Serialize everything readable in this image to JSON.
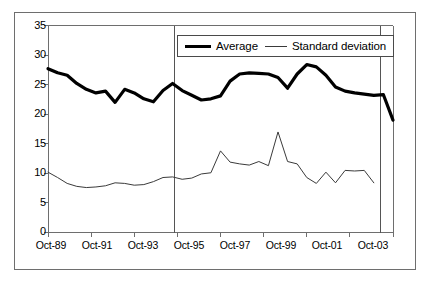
{
  "chart_data": {
    "type": "line",
    "title": "",
    "subtitle": "",
    "xlabel": "",
    "ylabel": "",
    "ylim": [
      0,
      35
    ],
    "yticks": [
      0,
      5,
      10,
      15,
      20,
      25,
      30,
      35
    ],
    "ytick_labels": [
      "0",
      "5",
      "10",
      "15",
      "20",
      "25",
      "30",
      "35"
    ],
    "grid": false,
    "legend_position": "top-center",
    "x": [
      "Oct-89",
      "Apr-90",
      "Oct-90",
      "Apr-91",
      "Oct-91",
      "Apr-92",
      "Oct-92",
      "Apr-93",
      "Oct-93",
      "Apr-94",
      "Oct-94",
      "Apr-95",
      "Oct-95",
      "Apr-96",
      "Oct-96",
      "Apr-97",
      "Oct-97",
      "Apr-98",
      "Oct-98",
      "Apr-99",
      "Oct-99",
      "Apr-00",
      "Oct-00",
      "Apr-01",
      "Oct-01",
      "Apr-02",
      "Oct-02",
      "Apr-03",
      "Oct-03",
      "Apr-04",
      "Oct-04"
    ],
    "xtick_labels": [
      "Oct-89",
      "Oct-91",
      "Oct-93",
      "Oct-95",
      "Oct-97",
      "Oct-99",
      "Oct-01",
      "Oct-03"
    ],
    "xtick_indices": [
      0,
      4,
      8,
      12,
      16,
      20,
      24,
      28
    ],
    "annotations": [
      {
        "type": "vline",
        "x_index": 12,
        "label": "Oct-95 reference line"
      },
      {
        "type": "vline",
        "x_index": 29,
        "label": "end reference line"
      }
    ],
    "series": [
      {
        "name": "Average",
        "color": "#000000",
        "width": 3.2,
        "values": [
          27.7,
          27.0,
          26.6,
          25.0,
          24.0,
          23.3,
          22.0,
          24.2,
          23.4,
          22.7,
          22.1,
          23.3,
          24.6,
          25.2,
          24.1,
          23.2,
          22.4,
          22.6,
          23.2,
          25.6,
          26.8,
          27.0,
          26.9,
          26.8,
          26.0,
          24.3,
          26.8,
          28.4,
          28.0,
          26.6,
          24.8
        ]
      },
      {
        "name": "Standard deviation",
        "color": "#3a3a3a",
        "width": 1,
        "values": [
          10.2,
          9.4,
          8.4,
          7.8,
          7.6,
          7.7,
          7.9,
          8.4,
          8.3,
          8.0,
          8.1,
          8.6,
          9.2,
          9.4,
          9.0,
          9.2,
          9.9,
          10.0,
          9.9,
          10.1,
          10.3,
          11.0,
          12.6,
          13.8,
          11.9,
          11.6,
          11.4,
          12.0,
          11.3,
          10.9,
          10.4
        ]
      }
    ],
    "series_tail": {
      "note": "continuation of both series beyond index 30 toward Oct-04",
      "average": [
        24.0,
        23.6,
        23.3,
        23.2,
        23.0,
        19.0
      ],
      "standard_deviation": [
        9.9,
        10.5,
        8.4
      ]
    },
    "average_full": [
      27.7,
      27.0,
      26.6,
      25.2,
      24.2,
      23.6,
      23.9,
      22.0,
      24.2,
      23.6,
      22.6,
      22.1,
      24.0,
      25.2,
      24.0,
      23.2,
      22.4,
      22.6,
      23.1,
      25.6,
      26.8,
      27.0,
      26.9,
      26.8,
      26.2,
      24.4,
      26.8,
      28.4,
      28.0,
      26.6,
      24.6,
      23.9,
      23.6,
      23.4,
      23.2,
      23.3,
      19.0
    ],
    "stddev_full": [
      10.2,
      9.3,
      8.3,
      7.8,
      7.6,
      7.7,
      7.9,
      8.4,
      8.3,
      8.0,
      8.1,
      8.6,
      9.3,
      9.4,
      9.0,
      9.2,
      9.9,
      10.1,
      13.8,
      11.9,
      11.6,
      11.4,
      12.0,
      11.3,
      17.0,
      12.0,
      11.6,
      9.3,
      8.3,
      10.2,
      8.4,
      10.5,
      10.4,
      10.5,
      8.4
    ]
  },
  "legend": {
    "items": [
      {
        "label": "Average",
        "style": "thick"
      },
      {
        "label": "Standard deviation",
        "style": "thin"
      }
    ]
  },
  "axes": {
    "y_labels": [
      "35",
      "30",
      "25",
      "20",
      "15",
      "10",
      "5",
      "0"
    ],
    "x_labels": [
      "Oct-89",
      "Oct-91",
      "Oct-93",
      "Oct-95",
      "Oct-97",
      "Oct-99",
      "Oct-01",
      "Oct-03"
    ]
  },
  "colors": {
    "average_line": "#000000",
    "stddev_line": "#3a3a3a",
    "axis": "#6e6e6e",
    "frame": "#6e6e6e",
    "background": "#ffffff"
  }
}
